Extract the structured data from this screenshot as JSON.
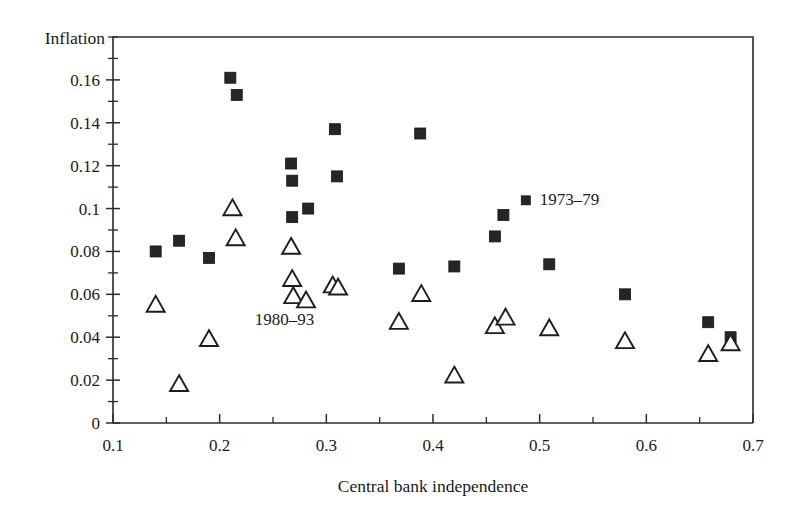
{
  "chart_data": {
    "type": "scatter",
    "title": "",
    "xlabel": "Central bank independence",
    "ylabel": "Inflation",
    "xlim": [
      0.1,
      0.7
    ],
    "ylim": [
      0,
      0.18
    ],
    "xticks": [
      0.1,
      0.2,
      0.3,
      0.4,
      0.5,
      0.6,
      0.7
    ],
    "xtick_labels": [
      "0.1",
      "0.2",
      "0.3",
      "0.4",
      "0.5",
      "0.6",
      "0.7"
    ],
    "xminor_step": 0.05,
    "yticks": [
      0,
      0.02,
      0.04,
      0.06,
      0.08,
      0.1,
      0.12,
      0.14,
      0.16
    ],
    "ytick_labels": [
      "0",
      "0.02",
      "0.04",
      "0.06",
      "0.08",
      "0.1",
      "0.12",
      "0.14",
      "0.16"
    ],
    "yminor_step": 0.01,
    "grid": false,
    "legend_position": "inline-annotations",
    "series": [
      {
        "name": "1973–79",
        "marker": "filled-square",
        "color": "#262626",
        "points": [
          {
            "x": 0.14,
            "y": 0.08
          },
          {
            "x": 0.162,
            "y": 0.085
          },
          {
            "x": 0.19,
            "y": 0.077
          },
          {
            "x": 0.21,
            "y": 0.161
          },
          {
            "x": 0.216,
            "y": 0.153
          },
          {
            "x": 0.267,
            "y": 0.121
          },
          {
            "x": 0.268,
            "y": 0.113
          },
          {
            "x": 0.268,
            "y": 0.096
          },
          {
            "x": 0.283,
            "y": 0.1
          },
          {
            "x": 0.308,
            "y": 0.137
          },
          {
            "x": 0.31,
            "y": 0.115
          },
          {
            "x": 0.368,
            "y": 0.072
          },
          {
            "x": 0.388,
            "y": 0.135
          },
          {
            "x": 0.42,
            "y": 0.073
          },
          {
            "x": 0.458,
            "y": 0.087
          },
          {
            "x": 0.466,
            "y": 0.097
          },
          {
            "x": 0.509,
            "y": 0.074
          },
          {
            "x": 0.58,
            "y": 0.06
          },
          {
            "x": 0.658,
            "y": 0.047
          },
          {
            "x": 0.679,
            "y": 0.04
          }
        ]
      },
      {
        "name": "1980–93",
        "marker": "open-triangle",
        "color": "#1d1d1d",
        "points": [
          {
            "x": 0.14,
            "y": 0.055
          },
          {
            "x": 0.162,
            "y": 0.018
          },
          {
            "x": 0.19,
            "y": 0.039
          },
          {
            "x": 0.212,
            "y": 0.1
          },
          {
            "x": 0.215,
            "y": 0.086
          },
          {
            "x": 0.267,
            "y": 0.082
          },
          {
            "x": 0.268,
            "y": 0.067
          },
          {
            "x": 0.269,
            "y": 0.059
          },
          {
            "x": 0.281,
            "y": 0.057
          },
          {
            "x": 0.306,
            "y": 0.064
          },
          {
            "x": 0.311,
            "y": 0.063
          },
          {
            "x": 0.368,
            "y": 0.047
          },
          {
            "x": 0.389,
            "y": 0.06
          },
          {
            "x": 0.42,
            "y": 0.022
          },
          {
            "x": 0.458,
            "y": 0.045
          },
          {
            "x": 0.468,
            "y": 0.049
          },
          {
            "x": 0.509,
            "y": 0.044
          },
          {
            "x": 0.58,
            "y": 0.038
          },
          {
            "x": 0.658,
            "y": 0.032
          },
          {
            "x": 0.679,
            "y": 0.037
          }
        ]
      }
    ],
    "annotations": [
      {
        "text": "1973–79",
        "x": 0.487,
        "y": 0.1015,
        "marker": "filled-square"
      },
      {
        "text": "1980–93",
        "x": 0.263,
        "y": 0.0455,
        "marker": "none"
      }
    ]
  }
}
